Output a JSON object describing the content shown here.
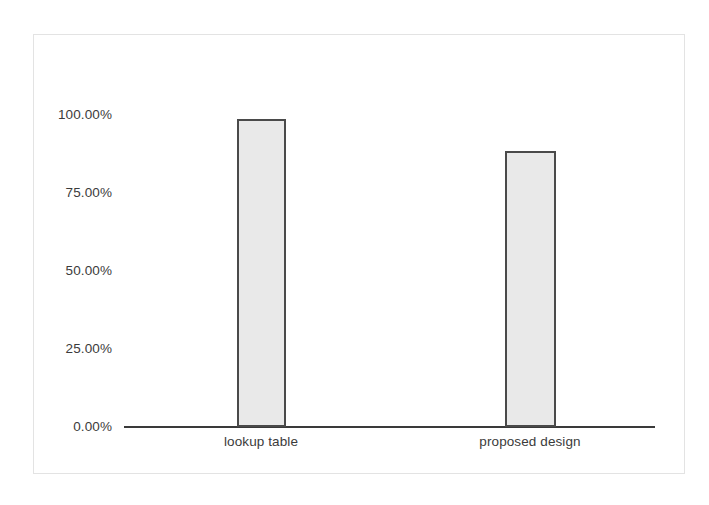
{
  "chart_data": {
    "type": "bar",
    "title": "",
    "subtitle": "",
    "xlabel": "",
    "ylabel": "",
    "categories": [
      "lookup table",
      "proposed design"
    ],
    "values": [
      98.7,
      88.5
    ],
    "value_format": "percent",
    "ylim": [
      0,
      100
    ],
    "yticks": [
      0,
      25,
      50,
      75,
      100
    ],
    "ytick_labels": [
      "0.00%",
      "25.00%",
      "50.00%",
      "75.00%",
      "100.00%"
    ],
    "grid": false,
    "legend": false,
    "legend_position": "none",
    "series": [
      {
        "name": "",
        "values": [
          98.7,
          88.5
        ]
      }
    ],
    "annotations": []
  },
  "axes": {
    "y": {
      "ticks": [
        {
          "label": "100.00%",
          "value": 100
        },
        {
          "label": "75.00%",
          "value": 75
        },
        {
          "label": "50.00%",
          "value": 50
        },
        {
          "label": "25.00%",
          "value": 25
        },
        {
          "label": "0.00%",
          "value": 0
        }
      ]
    },
    "x": {
      "ticks": [
        {
          "label": "lookup table"
        },
        {
          "label": "proposed design"
        }
      ]
    }
  },
  "style": {
    "bar_fill": "#e9e9e9",
    "bar_border": "#4a4a4a",
    "axis_color": "#3a3a3a",
    "text_color": "#3b3b3b",
    "frame_color": "#e3e3e3",
    "background": "#ffffff"
  }
}
